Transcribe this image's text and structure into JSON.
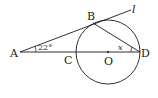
{
  "diagram": {
    "title": "",
    "points": [
      {
        "id": "A",
        "label": "A",
        "x": 20,
        "y": 52
      },
      {
        "id": "B",
        "label": "B",
        "x": 93,
        "y": 22
      },
      {
        "id": "C",
        "label": "C",
        "x": 76,
        "y": 52
      },
      {
        "id": "O",
        "label": "O",
        "x": 108,
        "y": 52
      },
      {
        "id": "D",
        "label": "D",
        "x": 140,
        "y": 52
      }
    ],
    "line_label": "l",
    "angle_A": "22°",
    "angle_D": "x",
    "circle": {
      "center": "O",
      "radius": 32
    },
    "segments": [
      "A–D (through C, O)",
      "A–B extended as tangent line l",
      "B–D"
    ],
    "stroke_color": "#1a1a1a"
  }
}
